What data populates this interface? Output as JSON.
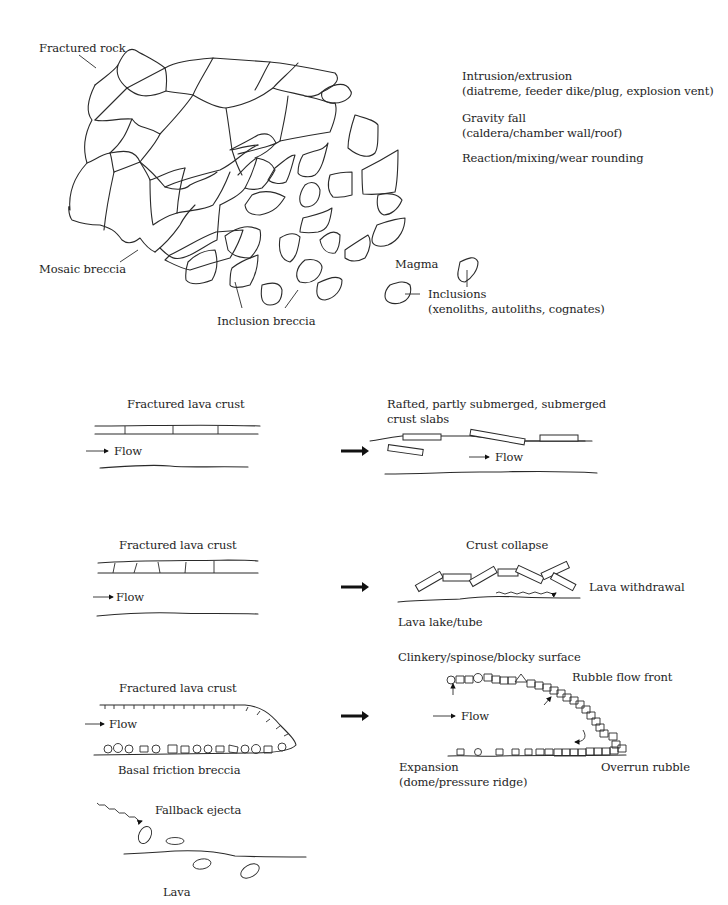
{
  "diagram": {
    "panel_1_magmatic_breccia": {
      "labels": {
        "fractured_rock": "Fractured rock",
        "mosaic_breccia": "Mosaic breccia",
        "inclusion_breccia": "Inclusion breccia",
        "magma": "Magma",
        "inclusions": "Inclusions",
        "inclusions_types": "(xenoliths, autoliths, cognates)"
      },
      "processes": [
        {
          "title": "Intrusion/extrusion",
          "detail": "(diatreme, feeder dike/plug, explosion vent)"
        },
        {
          "title": "Gravity fall",
          "detail": "(caldera/chamber wall/roof)"
        },
        {
          "title": "Reaction/mixing/wear rounding",
          "detail": ""
        }
      ]
    },
    "panel_2_rafted_crust": {
      "before": {
        "label": "Fractured lava crust",
        "flow": "Flow"
      },
      "after": {
        "label_line1": "Rafted, partly submerged, submerged",
        "label_line2": "crust slabs",
        "flow": "Flow"
      }
    },
    "panel_3_crust_collapse": {
      "before": {
        "label": "Fractured lava crust",
        "flow": "Flow"
      },
      "after": {
        "label": "Crust collapse",
        "withdrawal": "Lava withdrawal",
        "lake": "Lava lake/tube"
      }
    },
    "panel_4_rubble_flow": {
      "before": {
        "label": "Fractured lava crust",
        "flow": "Flow",
        "base": "Basal friction breccia"
      },
      "after": {
        "surface": "Clinkery/spinose/blocky surface",
        "front": "Rubble flow front",
        "flow": "Flow",
        "expansion_line1": "Expansion",
        "expansion_line2": "(dome/pressure ridge)",
        "overrun": "Overrun rubble"
      }
    },
    "panel_5_fallback": {
      "ejecta": "Fallback ejecta",
      "lava": "Lava"
    },
    "colors": {
      "line": "#2a2a2a",
      "text": "#1e1e1e",
      "background": "#ffffff"
    }
  }
}
